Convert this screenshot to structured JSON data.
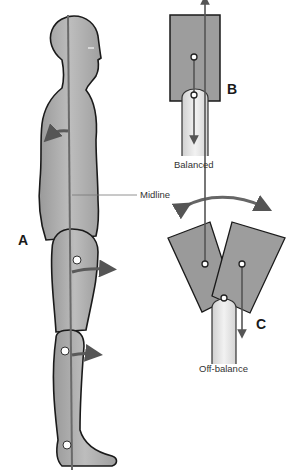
{
  "figure": {
    "panels": [
      {
        "id": "A",
        "label": "A",
        "description": "Human body side view with vertical midline and joint centers"
      },
      {
        "id": "B",
        "label": "B",
        "caption": "Balanced",
        "description": "Block centered over support with weight vector aligned"
      },
      {
        "id": "C",
        "label": "C",
        "caption": "Off-balance",
        "description": "Two tilted blocks with offset weight vectors and rocking arrow"
      }
    ],
    "midline_label": "Midline",
    "colors": {
      "body_fill": "#a9a9a9",
      "outline": "#1a1a1a",
      "line": "#6e6e6e",
      "arrow": "#5a5a5a",
      "block_fill": "#9a9a9a",
      "support_fill": "#e6e6e6"
    }
  }
}
